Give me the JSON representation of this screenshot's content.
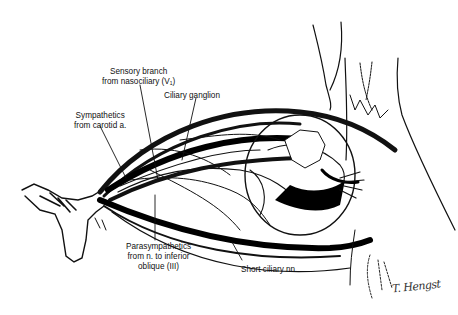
{
  "figure": {
    "background": "#ffffff",
    "ink": "#111111"
  },
  "labels": {
    "sensory_branch": {
      "line1": "Sensory branch",
      "line2": "from nasociliary (V₁)"
    },
    "ciliary_ganglion": {
      "line1": "Ciliary ganglion"
    },
    "sympathetics": {
      "line1": "Sympathetics",
      "line2": "from carotid a."
    },
    "parasympathetics": {
      "line1": "Parasympathetics",
      "line2": "from n. to inferior",
      "line3": "oblique (III)"
    },
    "short_ciliary": {
      "line1": "Short ciliary nn."
    }
  },
  "signature": "T. Hengst"
}
